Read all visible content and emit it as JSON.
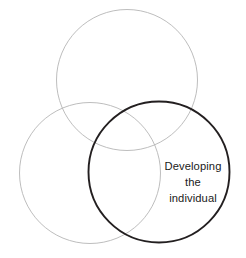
{
  "diagram": {
    "type": "venn",
    "background_color": "#ffffff",
    "canvas": {
      "width": 246,
      "height": 258
    },
    "circles": [
      {
        "id": "top",
        "name": "top-circle",
        "cx": 127,
        "cy": 80,
        "r": 70.5,
        "stroke_color": "#b5b5b5",
        "stroke_width": 0.9,
        "emphasis": "muted",
        "label": ""
      },
      {
        "id": "left",
        "name": "left-circle",
        "cx": 90,
        "cy": 173,
        "r": 70.5,
        "stroke_color": "#b5b5b5",
        "stroke_width": 0.9,
        "emphasis": "muted",
        "label": ""
      },
      {
        "id": "right",
        "name": "right-circle",
        "cx": 159,
        "cy": 172,
        "r": 70.5,
        "stroke_color": "#231f20",
        "stroke_width": 1.9,
        "emphasis": "highlighted",
        "label": "Developing the individual"
      }
    ],
    "label": {
      "lines": [
        "Developing",
        "the",
        "individual"
      ],
      "line_1": "Developing",
      "line_2": "the",
      "line_3": "individual",
      "color": "#1a1a1a",
      "x": 193,
      "y_line_1": 170,
      "y_line_2": 186,
      "y_line_3": 202,
      "line_height": 16,
      "font_size_px": 11.2,
      "align": "center"
    }
  }
}
